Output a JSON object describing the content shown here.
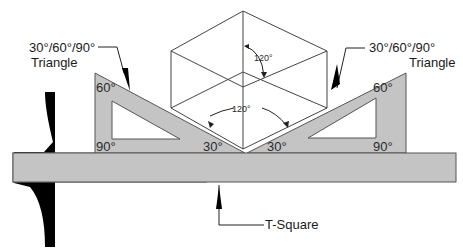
{
  "diagram": {
    "labels": {
      "left_triangle_line1": "30°/60°/90°",
      "left_triangle_line2": "Triangle",
      "right_triangle_line1": "30°/60°/90°",
      "right_triangle_line2": "Triangle",
      "t_square": "T-Square"
    },
    "angles": {
      "left_top": "60°",
      "left_bottom_left": "90°",
      "left_bottom_right": "30°",
      "right_top": "60°",
      "right_bottom_right": "90°",
      "right_bottom_left": "30°",
      "cube_top_angle": "120°",
      "cube_bottom_angle": "120°"
    },
    "colors": {
      "tool_fill": "#c4c4c4",
      "tool_stroke": "#555555",
      "head_fill": "#000000",
      "line": "#333333"
    }
  }
}
